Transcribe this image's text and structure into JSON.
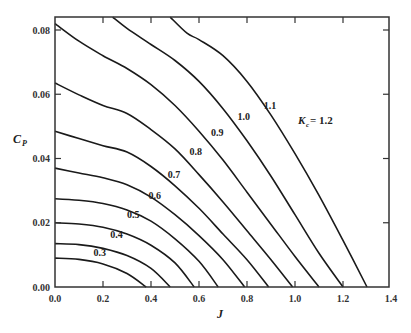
{
  "chart_data": {
    "type": "line",
    "title": "",
    "xlabel": "J",
    "ylabel": "C_P",
    "xlim": [
      0.0,
      1.4
    ],
    "ylim": [
      0.0,
      0.084
    ],
    "grid": false,
    "legend": "none (inline curve labels)",
    "x_ticks": [
      "0.0",
      "0.2",
      "0.4",
      "0.6",
      "0.8",
      "1.0",
      "1.2",
      "1.4"
    ],
    "y_ticks": [
      "0.00",
      "0.02",
      "0.04",
      "0.06",
      "0.08"
    ],
    "annotation_prefix": "K_c =",
    "series": [
      {
        "name": "0.3",
        "x": [
          0.0,
          0.1,
          0.2,
          0.3,
          0.38
        ],
        "y": [
          0.009,
          0.0086,
          0.0072,
          0.0042,
          0.0
        ]
      },
      {
        "name": "0.4",
        "x": [
          0.0,
          0.1,
          0.2,
          0.3,
          0.4,
          0.48
        ],
        "y": [
          0.0135,
          0.0132,
          0.012,
          0.0098,
          0.0058,
          0.0
        ]
      },
      {
        "name": "0.5",
        "x": [
          0.0,
          0.1,
          0.2,
          0.3,
          0.4,
          0.5,
          0.58
        ],
        "y": [
          0.02,
          0.0196,
          0.0186,
          0.0165,
          0.013,
          0.0075,
          0.0
        ]
      },
      {
        "name": "0.6",
        "x": [
          0.0,
          0.1,
          0.2,
          0.3,
          0.4,
          0.5,
          0.6,
          0.68
        ],
        "y": [
          0.0275,
          0.027,
          0.026,
          0.024,
          0.0205,
          0.015,
          0.008,
          0.0
        ]
      },
      {
        "name": "0.7",
        "x": [
          0.0,
          0.1,
          0.2,
          0.3,
          0.4,
          0.5,
          0.6,
          0.7,
          0.79
        ],
        "y": [
          0.037,
          0.0355,
          0.034,
          0.0318,
          0.028,
          0.0225,
          0.016,
          0.0085,
          0.0
        ]
      },
      {
        "name": "0.8",
        "x": [
          0.0,
          0.1,
          0.2,
          0.3,
          0.4,
          0.5,
          0.6,
          0.7,
          0.8,
          0.89
        ],
        "y": [
          0.0485,
          0.0462,
          0.044,
          0.042,
          0.0375,
          0.0315,
          0.0245,
          0.0165,
          0.0085,
          0.0
        ]
      },
      {
        "name": "0.9",
        "x": [
          0.0,
          0.1,
          0.2,
          0.3,
          0.4,
          0.5,
          0.6,
          0.7,
          0.8,
          0.9,
          0.99
        ],
        "y": [
          0.0635,
          0.0598,
          0.0565,
          0.054,
          0.049,
          0.043,
          0.035,
          0.0265,
          0.0175,
          0.0085,
          0.0
        ]
      },
      {
        "name": "1.0",
        "x": [
          0.0,
          0.1,
          0.2,
          0.3,
          0.4,
          0.5,
          0.6,
          0.7,
          0.8,
          0.9,
          1.0,
          1.1
        ],
        "y": [
          0.082,
          0.0765,
          0.072,
          0.068,
          0.063,
          0.0565,
          0.0485,
          0.0395,
          0.0295,
          0.0195,
          0.0095,
          0.0
        ]
      },
      {
        "name": "1.1",
        "x": [
          0.24,
          0.3,
          0.4,
          0.5,
          0.6,
          0.7,
          0.8,
          0.9,
          1.0,
          1.1,
          1.2
        ],
        "y": [
          0.084,
          0.0805,
          0.0755,
          0.0705,
          0.064,
          0.0555,
          0.0455,
          0.0345,
          0.0225,
          0.0105,
          0.0
        ]
      },
      {
        "name": "1.2",
        "x": [
          0.48,
          0.55,
          0.6,
          0.7,
          0.8,
          0.9,
          1.0,
          1.1,
          1.2,
          1.3
        ],
        "y": [
          0.084,
          0.079,
          0.077,
          0.072,
          0.064,
          0.0535,
          0.0415,
          0.0285,
          0.0145,
          0.0
        ]
      }
    ],
    "curve_labels": [
      {
        "text": "0.3",
        "x": 0.16,
        "y": 0.0098
      },
      {
        "text": "0.4",
        "x": 0.23,
        "y": 0.0152
      },
      {
        "text": "0.5",
        "x": 0.3,
        "y": 0.0215
      },
      {
        "text": "0.6",
        "x": 0.39,
        "y": 0.0275
      },
      {
        "text": "0.7",
        "x": 0.47,
        "y": 0.034
      },
      {
        "text": "0.8",
        "x": 0.56,
        "y": 0.041
      },
      {
        "text": "0.9",
        "x": 0.65,
        "y": 0.047
      },
      {
        "text": "1.0",
        "x": 0.76,
        "y": 0.052
      },
      {
        "text": "1.1",
        "x": 0.87,
        "y": 0.0555
      },
      {
        "text": "K_c = 1.2",
        "x": 0.95,
        "y": 0.061
      }
    ]
  },
  "labels": {
    "x_axis_title": "J",
    "y_axis_title_main": "C",
    "y_axis_title_sub": "P",
    "kc_main": "K",
    "kc_sub": "c",
    "kc_value": " = 1.2"
  }
}
